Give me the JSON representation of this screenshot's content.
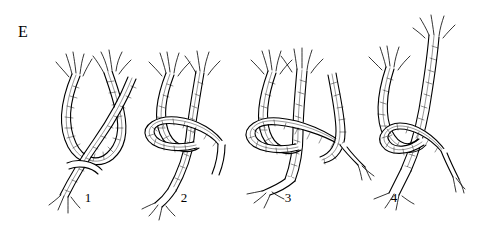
{
  "figure": {
    "panel_letter": "E",
    "background_color": "#ffffff",
    "ink_color": "#000000",
    "width": 492,
    "height": 229,
    "caption": ""
  },
  "steps": [
    {
      "label": "1",
      "x": 88,
      "y": 197
    },
    {
      "label": "2",
      "x": 184,
      "y": 197
    },
    {
      "label": "3",
      "x": 288,
      "y": 197
    },
    {
      "label": "4",
      "x": 394,
      "y": 197
    }
  ],
  "diagram": {
    "type": "knot-tying-sequence",
    "stage_count": 4,
    "style": "black-and-white line drawing with hatching"
  }
}
